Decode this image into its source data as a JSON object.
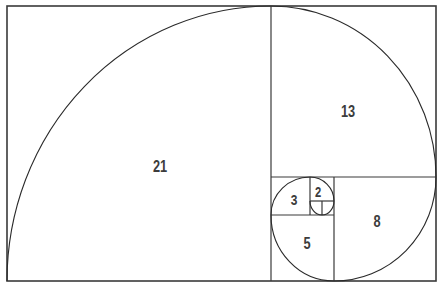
{
  "diagram": {
    "line_color": "#3a3a3a",
    "background": "#ffffff",
    "squares": [
      {
        "label": "21",
        "x": 7,
        "y": 6,
        "w": 264,
        "h": 275
      },
      {
        "label": "13",
        "x": 271,
        "y": 6,
        "w": 165,
        "h": 171
      },
      {
        "label": "8",
        "x": 334,
        "y": 177,
        "w": 102,
        "h": 104
      },
      {
        "label": "5",
        "x": 271,
        "y": 215,
        "w": 63,
        "h": 66
      },
      {
        "label": "3",
        "x": 271,
        "y": 177,
        "w": 39,
        "h": 38
      },
      {
        "label": "2",
        "x": 310,
        "y": 177,
        "w": 24,
        "h": 24
      },
      {
        "label": "",
        "x": 322,
        "y": 201,
        "w": 12,
        "h": 14
      },
      {
        "label": "",
        "x": 310,
        "y": 201,
        "w": 12,
        "h": 14
      }
    ],
    "labels": {
      "sq21": "21",
      "sq13": "13",
      "sq8": "8",
      "sq5": "5",
      "sq3": "3",
      "sq2": "2"
    }
  }
}
